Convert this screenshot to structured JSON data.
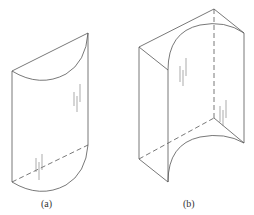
{
  "figures": [
    {
      "id": "a",
      "caption": "(a)",
      "description": "Half-cylinder shell with sloped top, curved face toward viewer, hidden base edge dashed"
    },
    {
      "id": "b",
      "caption": "(b)",
      "description": "Rectangular block with concave cylindrical cut-out, hidden edges dashed"
    }
  ],
  "colors": {
    "line": "#555555",
    "hatch": "#888888",
    "background": "#ffffff"
  }
}
